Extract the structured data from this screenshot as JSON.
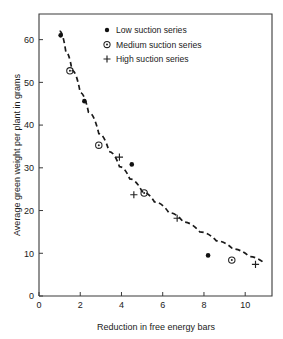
{
  "chart_data": {
    "type": "scatter",
    "title": "",
    "xlabel": "Reduction in free energy bars",
    "ylabel": "Average green weight per plant in grams",
    "xlim": [
      0,
      11.3
    ],
    "ylim": [
      0,
      66
    ],
    "xticks": [
      0,
      2,
      4,
      6,
      8,
      10
    ],
    "yticks": [
      0,
      10,
      20,
      30,
      40,
      50,
      60
    ],
    "xticklabels": [
      "0",
      "2",
      "4",
      "6",
      "8",
      "10"
    ],
    "yticklabels": [
      "0",
      "10",
      "20",
      "30",
      "40",
      "50",
      "60"
    ],
    "grid": false,
    "legend_position": "upper right",
    "series": [
      {
        "name": "Low suction series",
        "marker": "filled-circle",
        "points": [
          {
            "x": 1.05,
            "y": 61.0
          },
          {
            "x": 2.2,
            "y": 45.6
          },
          {
            "x": 4.5,
            "y": 30.8
          },
          {
            "x": 8.2,
            "y": 9.5
          }
        ]
      },
      {
        "name": "Medium suction series",
        "marker": "circle-with-dot",
        "points": [
          {
            "x": 1.5,
            "y": 52.7
          },
          {
            "x": 2.9,
            "y": 35.3
          },
          {
            "x": 5.1,
            "y": 24.1
          },
          {
            "x": 9.35,
            "y": 8.4
          }
        ]
      },
      {
        "name": "High suction series",
        "marker": "plus",
        "points": [
          {
            "x": 3.9,
            "y": 32.5
          },
          {
            "x": 4.6,
            "y": 23.7
          },
          {
            "x": 6.7,
            "y": 18.2
          },
          {
            "x": 10.5,
            "y": 7.4
          }
        ]
      }
    ],
    "fit_curve": {
      "style": "dashed",
      "points": [
        {
          "x": 1.0,
          "y": 62.0
        },
        {
          "x": 1.3,
          "y": 57.2
        },
        {
          "x": 1.6,
          "y": 52.8
        },
        {
          "x": 2.0,
          "y": 47.6
        },
        {
          "x": 2.4,
          "y": 43.0
        },
        {
          "x": 2.9,
          "y": 38.0
        },
        {
          "x": 3.4,
          "y": 33.8
        },
        {
          "x": 3.9,
          "y": 30.3
        },
        {
          "x": 4.4,
          "y": 27.4
        },
        {
          "x": 5.0,
          "y": 24.4
        },
        {
          "x": 5.6,
          "y": 22.0
        },
        {
          "x": 6.3,
          "y": 19.5
        },
        {
          "x": 7.0,
          "y": 17.3
        },
        {
          "x": 7.8,
          "y": 15.0
        },
        {
          "x": 8.6,
          "y": 12.9
        },
        {
          "x": 9.4,
          "y": 11.0
        },
        {
          "x": 10.2,
          "y": 9.2
        },
        {
          "x": 10.9,
          "y": 7.8
        }
      ]
    }
  },
  "legend": {
    "items": [
      {
        "label": "Low suction series",
        "marker": "filled-circle"
      },
      {
        "label": "Medium suction series",
        "marker": "circle-with-dot"
      },
      {
        "label": "High suction series",
        "marker": "plus"
      }
    ]
  },
  "colors": {
    "axis": "#3a3a3a",
    "marker": "#111111",
    "curve": "#1a1a1a",
    "background": "#ffffff"
  }
}
